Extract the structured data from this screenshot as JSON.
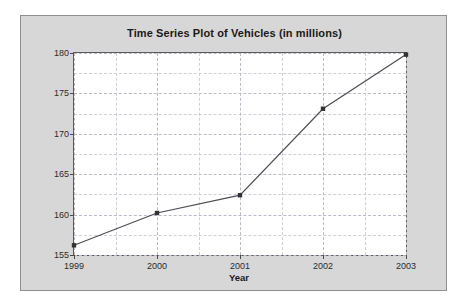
{
  "chart_data": {
    "type": "line",
    "title": "Time Series Plot of Vehicles (in millions)",
    "xlabel": "Year",
    "ylabel": "Vehicles (in millions)",
    "categories": [
      "1999",
      "2000",
      "2001",
      "2002",
      "2003"
    ],
    "x": [
      1999,
      2000,
      2001,
      2002,
      2003
    ],
    "values": [
      156.2,
      160.2,
      162.4,
      173.1,
      179.8
    ],
    "series": [
      {
        "name": "Vehicles",
        "values": [
          156.2,
          160.2,
          162.4,
          173.1,
          179.8
        ]
      }
    ],
    "ylim": [
      155,
      180
    ],
    "xlim": [
      1999,
      2003
    ],
    "y_ticks": [
      155,
      160,
      165,
      170,
      175,
      180
    ],
    "y_tick_labels": [
      "155",
      "160",
      "165",
      "170",
      "175",
      "180"
    ],
    "y_minor_step": 2.5,
    "x_ticks": [
      1999,
      2000,
      2001,
      2002,
      2003
    ],
    "x_tick_labels": [
      "1999",
      "2000",
      "2001",
      "2002",
      "2003"
    ],
    "grid": true,
    "legend": false,
    "legend_position": "none",
    "line_color": "#4d4d55",
    "marker": "square",
    "marker_color": "#333333",
    "plot_background": "#ffffff",
    "figure_background": "#d7d7d7",
    "grid_color": "#b9b9c9",
    "axis_color": "#5a5a5a",
    "text_color": "#1a1a1a"
  }
}
